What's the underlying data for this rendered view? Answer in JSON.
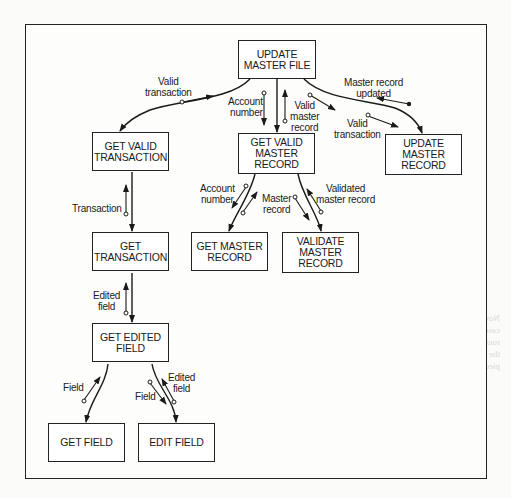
{
  "diagram": {
    "type": "structure-chart",
    "modules": [
      {
        "id": "update_master_file",
        "label": "UPDATE\nMASTER FILE"
      },
      {
        "id": "get_valid_transaction",
        "label": "GET VALID\nTRANSACTION"
      },
      {
        "id": "get_valid_master_record",
        "label": "GET VALID\nMASTER\nRECORD"
      },
      {
        "id": "update_master_record",
        "label": "UPDATE\nMASTER\nRECORD"
      },
      {
        "id": "get_transaction",
        "label": "GET\nTRANSACTION"
      },
      {
        "id": "get_master_record",
        "label": "GET MASTER\nRECORD"
      },
      {
        "id": "validate_master_record",
        "label": "VALIDATE\nMASTER\nRECORD"
      },
      {
        "id": "get_edited_field",
        "label": "GET EDITED\nFIELD"
      },
      {
        "id": "get_field",
        "label": "GET FIELD"
      },
      {
        "id": "edit_field",
        "label": "EDIT FIELD"
      }
    ],
    "couples": [
      {
        "label": "Valid\ntransaction",
        "from": "get_valid_transaction",
        "to": "update_master_file"
      },
      {
        "label": "Account\nnumber",
        "from": "update_master_file",
        "to": "get_valid_master_record"
      },
      {
        "label": "Valid\nmaster\nrecord",
        "from": "get_valid_master_record",
        "to": "update_master_file"
      },
      {
        "label": "Master record\nupdated",
        "from": "update_master_record",
        "to": "update_master_file"
      },
      {
        "label": "Valid\ntransaction",
        "from": "update_master_file",
        "to": "update_master_record",
        "id": "valid_transaction_2"
      },
      {
        "label": "Transaction",
        "from": "get_transaction",
        "to": "get_valid_transaction"
      },
      {
        "label": "Account\nnumber",
        "from": "get_valid_master_record",
        "to": "get_master_record",
        "id": "account_number_2"
      },
      {
        "label": "Master\nrecord",
        "from": "get_master_record",
        "to": "get_valid_master_record"
      },
      {
        "label": "Validated\nmaster record",
        "from": "validate_master_record",
        "to": "get_valid_master_record"
      },
      {
        "label": "Edited\nfield",
        "from": "get_edited_field",
        "to": "get_transaction"
      },
      {
        "label": "Field",
        "from": "get_field",
        "to": "get_edited_field"
      },
      {
        "label": "Field",
        "from": "get_edited_field",
        "to": "edit_field",
        "id": "field_2"
      },
      {
        "label": "Edited\nfield",
        "from": "edit_field",
        "to": "get_edited_field",
        "id": "edited_field_2"
      }
    ]
  },
  "background_bleed": "Now we must write and develop the final structure chart. In this case the whole diagram is correct; we proceed and write similar routines as modules from tables. In our final structure we use the routine GET VALID TRANSACTION, then the other pieces. Finally, our final structure chart..."
}
